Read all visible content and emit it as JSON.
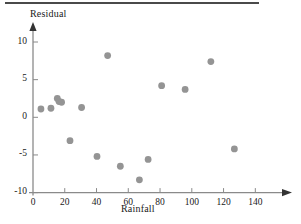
{
  "figure": {
    "name": "residual-plot",
    "rule_present": true
  },
  "chart_data": {
    "type": "scatter",
    "title": "",
    "xlabel": "Rainfall",
    "ylabel": "Residual",
    "xlim": [
      0,
      150
    ],
    "ylim": [
      -10,
      11
    ],
    "xticks": [
      0,
      20,
      40,
      60,
      80,
      100,
      120,
      140
    ],
    "xtick_labels": [
      "0",
      "20",
      "40",
      "60",
      "80",
      "100",
      "120",
      "140"
    ],
    "yticks": [
      -10,
      -5,
      0,
      5,
      10
    ],
    "ytick_labels": [
      "-10",
      "-5",
      "0",
      "5",
      "10"
    ],
    "grid": false,
    "legend": null,
    "marker": {
      "shape": "circle",
      "color": "#949494",
      "size": 3.4
    },
    "axis_color": "#8a8a8a",
    "points": [
      {
        "x": 5.0,
        "y": 1.1
      },
      {
        "x": 11.3,
        "y": 1.2
      },
      {
        "x": 15.3,
        "y": 2.5
      },
      {
        "x": 16.4,
        "y": 2.1
      },
      {
        "x": 18.0,
        "y": 2.0
      },
      {
        "x": 23.3,
        "y": -3.1
      },
      {
        "x": 30.6,
        "y": 1.3
      },
      {
        "x": 40.3,
        "y": -5.2
      },
      {
        "x": 47.0,
        "y": 8.2
      },
      {
        "x": 55.0,
        "y": -6.5
      },
      {
        "x": 67.0,
        "y": -8.3
      },
      {
        "x": 72.5,
        "y": -5.6
      },
      {
        "x": 81.0,
        "y": 4.2
      },
      {
        "x": 95.8,
        "y": 3.7
      },
      {
        "x": 112.0,
        "y": 7.4
      },
      {
        "x": 126.8,
        "y": -4.2
      }
    ]
  }
}
